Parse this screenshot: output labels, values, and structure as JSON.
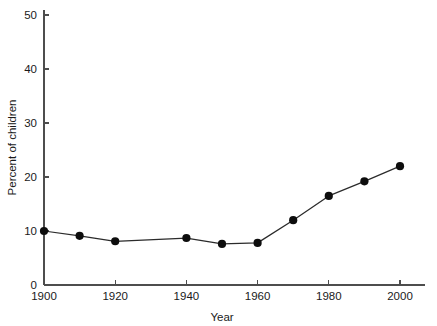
{
  "chart_data": {
    "type": "line",
    "title": "",
    "subtitle": "",
    "xlabel": "Year",
    "ylabel": "Percent of children",
    "xlim": [
      1900,
      2010
    ],
    "ylim": [
      0,
      50
    ],
    "xticks": [
      1900,
      1920,
      1940,
      1960,
      1980,
      2000
    ],
    "xtick_labels": [
      "1900",
      "1920",
      "1940",
      "1960",
      "1980",
      "2000"
    ],
    "yticks": [
      0,
      10,
      20,
      30,
      40,
      50
    ],
    "ytick_labels": [
      "0",
      "10",
      "20",
      "30",
      "40",
      "50"
    ],
    "grid": false,
    "legend": false,
    "legend_position": "none",
    "marker": "filled-circle",
    "marker_color": "#0d0d0d",
    "line_color": "#2b2b2b",
    "x": [
      1900,
      1910,
      1920,
      1940,
      1950,
      1960,
      1970,
      1980,
      1990,
      2000
    ],
    "values": [
      10.0,
      9.1,
      8.1,
      8.7,
      7.6,
      7.8,
      12.0,
      16.5,
      19.2,
      22.0
    ],
    "points": [
      {
        "x": 1900,
        "y": 10.0
      },
      {
        "x": 1910,
        "y": 9.1
      },
      {
        "x": 1920,
        "y": 8.1
      },
      {
        "x": 1940,
        "y": 8.7
      },
      {
        "x": 1950,
        "y": 7.6
      },
      {
        "x": 1960,
        "y": 7.8
      },
      {
        "x": 1970,
        "y": 12.0
      },
      {
        "x": 1980,
        "y": 16.5
      },
      {
        "x": 1990,
        "y": 19.2
      },
      {
        "x": 2000,
        "y": 22.0
      }
    ]
  }
}
